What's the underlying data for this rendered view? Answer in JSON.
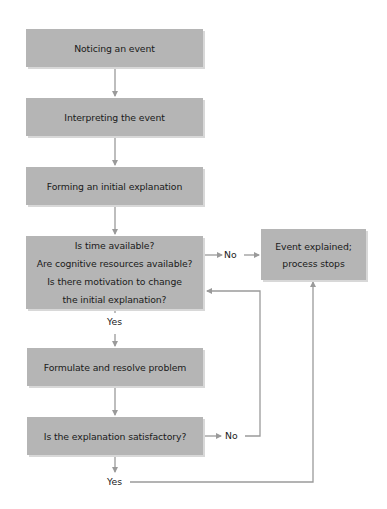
{
  "diagram": {
    "type": "flowchart",
    "colors": {
      "box_fill": "#b5b5b5",
      "arrow": "#9a9a9a",
      "text": "#1a1a1a"
    },
    "nodes": {
      "noticing": {
        "label": "Noticing an event"
      },
      "interpreting": {
        "label": "Interpreting the event"
      },
      "forming": {
        "label": "Forming an initial explanation"
      },
      "decision": {
        "lines": [
          "Is time available?",
          "Are cognitive resources available?",
          "Is there motivation to change",
          "the initial explanation?"
        ]
      },
      "explained": {
        "lines": [
          "Event explained;",
          "process stops"
        ]
      },
      "formulate": {
        "label": "Formulate and resolve problem"
      },
      "satisfactory": {
        "label": "Is the explanation satisfactory?"
      }
    },
    "edge_labels": {
      "decision_no": "No",
      "decision_yes": "Yes",
      "satisfactory_no": "No",
      "satisfactory_yes": "Yes"
    },
    "edges": [
      {
        "from": "noticing",
        "to": "interpreting"
      },
      {
        "from": "interpreting",
        "to": "forming"
      },
      {
        "from": "forming",
        "to": "decision"
      },
      {
        "from": "decision",
        "to": "explained",
        "label": "No"
      },
      {
        "from": "decision",
        "to": "formulate",
        "label": "Yes"
      },
      {
        "from": "formulate",
        "to": "satisfactory"
      },
      {
        "from": "satisfactory",
        "to": "decision",
        "label": "No"
      },
      {
        "from": "satisfactory",
        "to": "explained",
        "label": "Yes"
      }
    ]
  }
}
